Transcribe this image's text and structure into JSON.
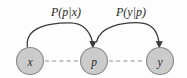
{
  "diagram": {
    "type": "directed-graph",
    "background_color": "#fdfdfd",
    "nodes": [
      {
        "id": "x",
        "label": "x",
        "name": "node-x",
        "cx": 30,
        "cy": 61,
        "r": 13.5,
        "fill_color": "#cbcbcb",
        "stroke_color": "#8a8a8a"
      },
      {
        "id": "p",
        "label": "p",
        "name": "node-p",
        "cx": 94,
        "cy": 61,
        "r": 13.5,
        "fill_color": "#cbcbcb",
        "stroke_color": "#8a8a8a"
      },
      {
        "id": "y",
        "label": "y",
        "name": "node-y",
        "cx": 160,
        "cy": 61,
        "r": 13.5,
        "fill_color": "#cbcbcb",
        "stroke_color": "#8a8a8a"
      }
    ],
    "directed_edges": [
      {
        "id": "x-to-p",
        "from": "x",
        "to": "p",
        "label": "P(p|x)",
        "label_x": 66,
        "label_y": 16,
        "style": "curved-arc",
        "arrowhead": true,
        "color": "#3a3a3a"
      },
      {
        "id": "p-to-y",
        "from": "p",
        "to": "y",
        "label": "P(y|p)",
        "label_x": 131,
        "label_y": 16,
        "style": "curved-arc",
        "arrowhead": true,
        "color": "#3a3a3a"
      }
    ],
    "dashed_links": [
      {
        "id": "x-p-dashed",
        "from": "x",
        "to": "p",
        "color": "#8f8f8f"
      },
      {
        "id": "p-y-dashed",
        "from": "p",
        "to": "y",
        "color": "#8f8f8f"
      }
    ]
  }
}
